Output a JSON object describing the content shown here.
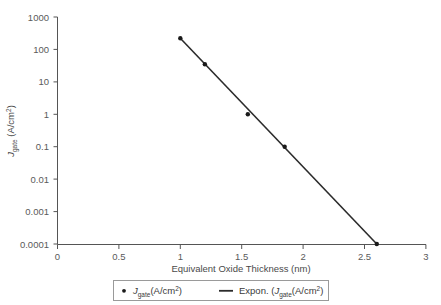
{
  "chart_data": {
    "type": "scatter",
    "title": "",
    "xlabel": "Equivalent Oxide Thickness (nm)",
    "ylabel": "J_gate (A/cm^2)",
    "ylabel_parts": {
      "italic": "J",
      "subscript": "gate",
      "units": " (A/cm",
      "superscript": "2",
      "close": ")"
    },
    "xlim": [
      0,
      3
    ],
    "ylim": [
      0.0001,
      1000
    ],
    "yscale": "log",
    "xscale": "linear",
    "grid": false,
    "xticks": [
      "0",
      "0.5",
      "1",
      "1.5",
      "2",
      "2.5",
      "3"
    ],
    "xtick_values": [
      0,
      0.5,
      1,
      1.5,
      2,
      2.5,
      3
    ],
    "yticks": [
      "1000",
      "100",
      "10",
      "1",
      "0.1",
      "0.01",
      "0.001",
      "0.0001"
    ],
    "ytick_values": [
      1000,
      100,
      10,
      1,
      0.1,
      0.01,
      0.001,
      0.0001
    ],
    "x": [
      1.0,
      1.2,
      1.55,
      1.85,
      2.6
    ],
    "y": [
      220,
      35,
      1.0,
      0.1,
      0.0001
    ],
    "points": [
      {
        "x": 1.0,
        "y": 220
      },
      {
        "x": 1.2,
        "y": 35
      },
      {
        "x": 1.55,
        "y": 1.0
      },
      {
        "x": 1.85,
        "y": 0.1
      },
      {
        "x": 2.6,
        "y": 0.0001
      }
    ],
    "trendline": {
      "type": "exponential",
      "x_start": 1.0,
      "y_start": 220,
      "x_end": 2.6,
      "y_end": 0.0001
    },
    "legend_position": "bottom",
    "series": [
      {
        "name": "J_gate(A/cm^2)",
        "marker": "dot",
        "style": "markers"
      },
      {
        "name": "Expon. (J_gate(A/cm^2)",
        "marker": "line",
        "style": "line"
      }
    ],
    "colors": {
      "line": "#2b2b2b",
      "marker": "#1a1a1a",
      "axis": "#555555",
      "text": "#5a5a5a"
    }
  },
  "legend": {
    "entries": [
      {
        "symbol": "dot-marker",
        "italic": "J",
        "subscript": "gate",
        "units": "(A/cm",
        "superscript": "2",
        "close": ")"
      },
      {
        "symbol": "line-marker",
        "prefix": "Expon. (",
        "italic": "J",
        "subscript": "gate",
        "units": "(A/cm",
        "superscript": "2",
        "close": ")"
      }
    ]
  }
}
